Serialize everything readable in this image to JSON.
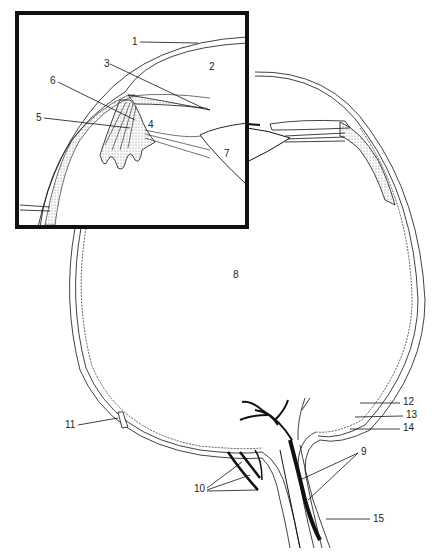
{
  "diagram": {
    "colors": {
      "line": "#111111",
      "background": "#ffffff",
      "stipple": "#555555"
    },
    "inset": {
      "description": "magnified view of anterior chamber angle, ciliary body and lens"
    },
    "labels": [
      {
        "id": "1",
        "text": "1",
        "x": 132,
        "y": 38
      },
      {
        "id": "2",
        "text": "2",
        "x": 209,
        "y": 62
      },
      {
        "id": "3",
        "text": "3",
        "x": 104,
        "y": 60
      },
      {
        "id": "4",
        "text": "4",
        "x": 148,
        "y": 120
      },
      {
        "id": "5",
        "text": "5",
        "x": 36,
        "y": 114
      },
      {
        "id": "6",
        "text": "6",
        "x": 50,
        "y": 77
      },
      {
        "id": "7",
        "text": "7",
        "x": 224,
        "y": 150
      },
      {
        "id": "8",
        "text": "8",
        "x": 233,
        "y": 270
      },
      {
        "id": "9",
        "text": "9",
        "x": 361,
        "y": 448
      },
      {
        "id": "10",
        "text": "10",
        "x": 194,
        "y": 485
      },
      {
        "id": "11",
        "text": "11",
        "x": 65,
        "y": 421
      },
      {
        "id": "12",
        "text": "12",
        "x": 403,
        "y": 398
      },
      {
        "id": "13",
        "text": "13",
        "x": 406,
        "y": 411
      },
      {
        "id": "14",
        "text": "14",
        "x": 403,
        "y": 424
      },
      {
        "id": "15",
        "text": "15",
        "x": 373,
        "y": 515
      }
    ]
  }
}
